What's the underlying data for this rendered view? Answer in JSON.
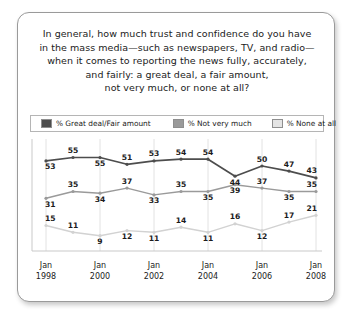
{
  "question": {
    "lines": [
      "In general, how much trust and confidence do you have",
      "in the mass media—such as newspapers, TV, and radio—",
      "when it comes to reporting the news fully, accurately,",
      "and fairly: a great deal, a fair amount,",
      "not very much, or none at all?"
    ]
  },
  "legend": {
    "items": [
      {
        "label": "% Great deal/Fair amount",
        "color": "#4d4d4d"
      },
      {
        "label": "% Not very much",
        "color": "#9a9a9a"
      },
      {
        "label": "% None at all",
        "color": "#d2d2d2"
      }
    ]
  },
  "chart_data": {
    "type": "line",
    "xlabel": "",
    "ylabel": "",
    "ylim": [
      0,
      60
    ],
    "grid": "vertical",
    "legend_position": "top",
    "x": [
      "Jan 1998",
      "Jan 1999",
      "Jan 2000",
      "Jan 2001",
      "Jan 2002",
      "Jan 2003",
      "Jan 2004",
      "Jan 2005",
      "Jan 2006",
      "Jan 2007",
      "Jan 2008"
    ],
    "tick_labels": [
      {
        "index": 0,
        "top": "Jan",
        "bottom": "1998"
      },
      {
        "index": 2,
        "top": "Jan",
        "bottom": "2000"
      },
      {
        "index": 4,
        "top": "Jan",
        "bottom": "2002"
      },
      {
        "index": 6,
        "top": "Jan",
        "bottom": "2004"
      },
      {
        "index": 8,
        "top": "Jan",
        "bottom": "2006"
      },
      {
        "index": 10,
        "top": "Jan",
        "bottom": "2008"
      }
    ],
    "series": [
      {
        "name": "% Great deal/Fair amount",
        "color": "#4d4d4d",
        "values": [
          53,
          55,
          55,
          51,
          53,
          54,
          54,
          44,
          50,
          47,
          43
        ],
        "label_positions": [
          "below",
          "above",
          "below",
          "above",
          "above",
          "above",
          "above",
          "below",
          "above",
          "above",
          "above"
        ]
      },
      {
        "name": "% Not very much",
        "color": "#9a9a9a",
        "values": [
          31,
          35,
          34,
          37,
          33,
          35,
          35,
          39,
          37,
          35,
          35
        ],
        "label_positions": [
          "below",
          "above",
          "below",
          "above",
          "below",
          "above",
          "below",
          "below",
          "above",
          "below",
          "above"
        ]
      },
      {
        "name": "% None at all",
        "color": "#d2d2d2",
        "values": [
          15,
          11,
          9,
          12,
          11,
          14,
          11,
          16,
          12,
          17,
          21
        ],
        "label_positions": [
          "above",
          "above",
          "below",
          "below",
          "below",
          "above",
          "below",
          "above",
          "below",
          "above",
          "above"
        ]
      }
    ]
  }
}
